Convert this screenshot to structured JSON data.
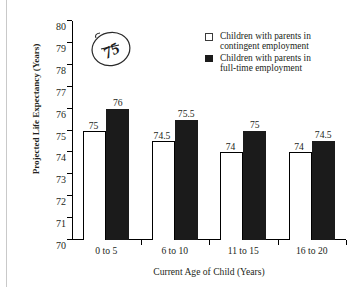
{
  "chart_data": {
    "type": "bar",
    "title": "",
    "xlabel": "Current Age of Child (Years)",
    "ylabel": "Projected Life Expectancy (Years)",
    "categories": [
      "0 to 5",
      "6 to 10",
      "11 to 15",
      "16 to 20"
    ],
    "series": [
      {
        "name": "Children with parents in contingent employment",
        "color": "#ffffff",
        "values": [
          75,
          74.5,
          74,
          74
        ],
        "labels": [
          "75",
          "74.5",
          "74",
          "74"
        ]
      },
      {
        "name": "Children with parents in full-time employment",
        "color": "#1b1b1b",
        "values": [
          76,
          75.5,
          75,
          74.5
        ],
        "labels": [
          "76",
          "75.5",
          "75",
          "74.5"
        ]
      }
    ],
    "ylim": [
      70,
      80
    ],
    "ytick_values": [
      70,
      71,
      72,
      73,
      74,
      75,
      76,
      77,
      78,
      79,
      80
    ],
    "ytick_labels": [
      "70",
      "71",
      "72",
      "73",
      "74",
      "75",
      "76",
      "77",
      "78",
      "79",
      "80"
    ],
    "grid": false,
    "legend_position": "top-right"
  },
  "legend": {
    "entries": [
      {
        "swatch": "open-square",
        "line1": "Children with parents in",
        "line2": "contingent employment"
      },
      {
        "swatch": "filled-square",
        "line1": "Children with parents in",
        "line2": "full-time employment"
      }
    ]
  },
  "annotation": {
    "text": "75",
    "style": "handwritten-circled"
  }
}
